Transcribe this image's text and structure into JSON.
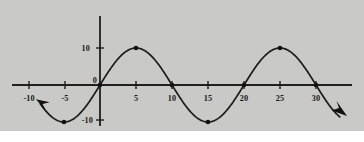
{
  "figure": {
    "background_color": "#c9c9c7",
    "page_color": "#ffffff",
    "ink_color": "#1b1a18"
  },
  "chart_data": {
    "type": "line",
    "title": "",
    "subtitle": "",
    "xlabel": "",
    "ylabel": "",
    "function": "y = 10 sin(2*pi*x/20)",
    "amplitude": 10,
    "period": 20,
    "xlim": [
      -11.5,
      34
    ],
    "ylim": [
      -13,
      13
    ],
    "grid": false,
    "legend": false,
    "legend_position": "none",
    "x_ticks": [
      -10,
      -5,
      0,
      5,
      10,
      15,
      20,
      25,
      30
    ],
    "x_tick_labels": [
      "-10",
      "-5",
      "",
      "5",
      "10",
      "15",
      "20",
      "25",
      "30"
    ],
    "y_ticks": [
      -10,
      0,
      10
    ],
    "y_tick_labels": [
      "-10",
      "0",
      "10"
    ],
    "origin_label": "0",
    "series": [
      {
        "name": "sine-curve",
        "x": [
          -7.5,
          -5,
          -2.5,
          0,
          2.5,
          5,
          7.5,
          10,
          12.5,
          15,
          17.5,
          20,
          22.5,
          25,
          27.5,
          30,
          32.5
        ],
        "values": [
          -7.07,
          -10,
          -7.07,
          0,
          7.07,
          10,
          7.07,
          0,
          -7.07,
          -10,
          -7.07,
          0,
          7.07,
          10,
          7.07,
          0,
          -7.07
        ]
      }
    ],
    "marked_points": [
      {
        "x": -5,
        "y": -10,
        "kind": "minimum"
      },
      {
        "x": 0,
        "y": 0,
        "kind": "zero-crossing"
      },
      {
        "x": 5,
        "y": 10,
        "kind": "maximum"
      },
      {
        "x": 10,
        "y": 0,
        "kind": "zero-crossing"
      },
      {
        "x": 15,
        "y": -10,
        "kind": "minimum"
      },
      {
        "x": 20,
        "y": 0,
        "kind": "zero-crossing"
      },
      {
        "x": 25,
        "y": 10,
        "kind": "maximum"
      },
      {
        "x": 30,
        "y": 0,
        "kind": "zero-crossing"
      }
    ],
    "annotations": [
      {
        "name": "left-arrowhead",
        "x": -8.6,
        "y": -4.4,
        "direction": "up-left"
      },
      {
        "name": "right-arrowhead",
        "x": 33.6,
        "y": -7.6,
        "direction": "down-right"
      }
    ]
  }
}
